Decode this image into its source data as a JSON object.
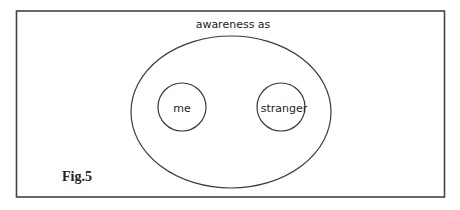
{
  "figure": {
    "title": "awareness as",
    "inner_left_label": "me",
    "inner_right_label": "stranger",
    "caption": "Fig.5"
  },
  "colors": {
    "stroke": "#3a3a3a",
    "frame": "#444444",
    "text": "#222222",
    "background": "#ffffff"
  }
}
